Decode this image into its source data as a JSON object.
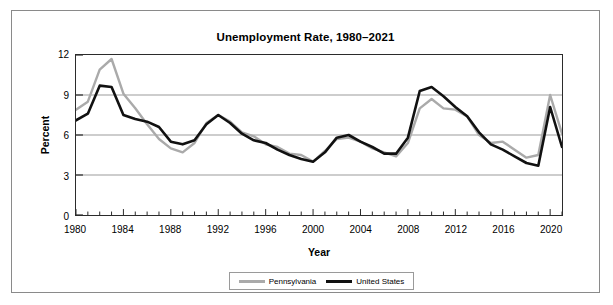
{
  "chart_data": {
    "type": "line",
    "title": "Unemployment Rate, 1980–2021",
    "xlabel": "Year",
    "ylabel": "Percent",
    "ylim": [
      0,
      12
    ],
    "yticks": [
      0,
      3,
      6,
      9,
      12
    ],
    "xlim": [
      1980,
      2021
    ],
    "xticks": [
      1980,
      1984,
      1988,
      1992,
      1996,
      2000,
      2004,
      2008,
      2012,
      2016,
      2020
    ],
    "minor_xtick_step": 1,
    "grid": "horizontal",
    "legend_position": "bottom-center",
    "x": [
      1980,
      1981,
      1982,
      1983,
      1984,
      1985,
      1986,
      1987,
      1988,
      1989,
      1990,
      1991,
      1992,
      1993,
      1994,
      1995,
      1996,
      1997,
      1998,
      1999,
      2000,
      2001,
      2002,
      2003,
      2004,
      2005,
      2006,
      2007,
      2008,
      2009,
      2010,
      2011,
      2012,
      2013,
      2014,
      2015,
      2016,
      2017,
      2018,
      2019,
      2020,
      2021
    ],
    "series": [
      {
        "name": "Pennsylvania",
        "color": "#aaaaaa",
        "values": [
          7.9,
          8.5,
          10.9,
          11.7,
          9.1,
          8.0,
          6.8,
          5.7,
          5.0,
          4.7,
          5.4,
          6.9,
          7.5,
          7.0,
          6.2,
          5.9,
          5.3,
          5.1,
          4.6,
          4.5,
          4.0,
          4.8,
          5.7,
          5.8,
          5.5,
          5.0,
          4.7,
          4.4,
          5.4,
          8.0,
          8.7,
          8.0,
          7.9,
          7.4,
          6.0,
          5.4,
          5.5,
          4.9,
          4.3,
          4.5,
          9.0,
          6.1
        ]
      },
      {
        "name": "United States",
        "color": "#111111",
        "values": [
          7.1,
          7.6,
          9.7,
          9.6,
          7.5,
          7.2,
          7.0,
          6.6,
          5.5,
          5.3,
          5.6,
          6.8,
          7.5,
          6.9,
          6.1,
          5.6,
          5.4,
          4.9,
          4.5,
          4.2,
          4.0,
          4.7,
          5.8,
          6.0,
          5.5,
          5.1,
          4.6,
          4.6,
          5.8,
          9.3,
          9.6,
          8.9,
          8.1,
          7.4,
          6.2,
          5.3,
          4.9,
          4.4,
          3.9,
          3.7,
          8.1,
          5.1
        ]
      }
    ]
  },
  "legend": {
    "items": [
      {
        "label": "Pennsylvania"
      },
      {
        "label": "United States"
      }
    ]
  }
}
